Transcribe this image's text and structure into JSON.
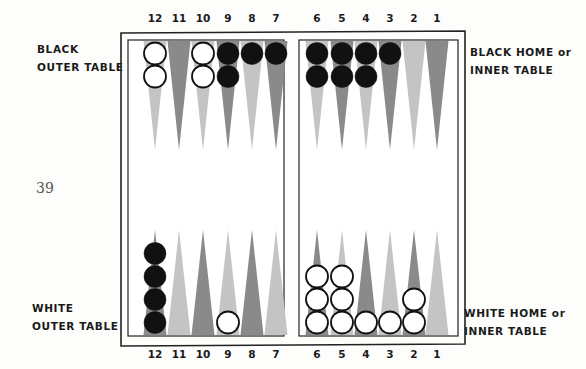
{
  "page_number": "39",
  "labels": {
    "black_outer": [
      "BLACK",
      "OUTER TABLE"
    ],
    "black_home": [
      "BLACK HOME or",
      "INNER TABLE"
    ],
    "white_outer": [
      "WHITE",
      "OUTER TABLE"
    ],
    "white_home": [
      "WHITE HOME or",
      "INNER TABLE"
    ]
  },
  "point_numbers_top": [
    "12",
    "11",
    "10",
    "9",
    "8",
    "7",
    "6",
    "5",
    "4",
    "3",
    "2",
    "1"
  ],
  "point_numbers_bottom": [
    "12",
    "11",
    "10",
    "9",
    "8",
    "7",
    "6",
    "5",
    "4",
    "3",
    "2",
    "1"
  ],
  "colors": {
    "dark_point": "#8a8a8a",
    "light_point": "#c4c4c4",
    "black_checker": "#111111",
    "white_checker": "#ffffff",
    "frame": "#222222"
  },
  "board": {
    "top_points": [
      {
        "point": "12",
        "shade": "light",
        "checkers": {
          "color": "white",
          "count": 2
        }
      },
      {
        "point": "11",
        "shade": "dark",
        "checkers": null
      },
      {
        "point": "10",
        "shade": "light",
        "checkers": {
          "color": "white",
          "count": 2
        }
      },
      {
        "point": "9",
        "shade": "dark",
        "checkers": {
          "color": "black",
          "count": 2
        }
      },
      {
        "point": "8",
        "shade": "light",
        "checkers": {
          "color": "black",
          "count": 1
        }
      },
      {
        "point": "7",
        "shade": "dark",
        "checkers": {
          "color": "black",
          "count": 1
        }
      },
      {
        "point": "6",
        "shade": "light",
        "checkers": {
          "color": "black",
          "count": 2
        }
      },
      {
        "point": "5",
        "shade": "dark",
        "checkers": {
          "color": "black",
          "count": 2
        }
      },
      {
        "point": "4",
        "shade": "light",
        "checkers": {
          "color": "black",
          "count": 2
        }
      },
      {
        "point": "3",
        "shade": "dark",
        "checkers": {
          "color": "black",
          "count": 1
        }
      },
      {
        "point": "2",
        "shade": "light",
        "checkers": null
      },
      {
        "point": "1",
        "shade": "dark",
        "checkers": null
      }
    ],
    "bottom_points": [
      {
        "point": "12",
        "shade": "dark",
        "checkers": {
          "color": "black",
          "count": 4
        }
      },
      {
        "point": "11",
        "shade": "light",
        "checkers": null
      },
      {
        "point": "10",
        "shade": "dark",
        "checkers": null
      },
      {
        "point": "9",
        "shade": "light",
        "checkers": {
          "color": "white",
          "count": 1
        }
      },
      {
        "point": "8",
        "shade": "dark",
        "checkers": null
      },
      {
        "point": "7",
        "shade": "light",
        "checkers": null
      },
      {
        "point": "6",
        "shade": "dark",
        "checkers": {
          "color": "white",
          "count": 3
        }
      },
      {
        "point": "5",
        "shade": "light",
        "checkers": {
          "color": "white",
          "count": 3
        }
      },
      {
        "point": "4",
        "shade": "dark",
        "checkers": {
          "color": "white",
          "count": 1
        }
      },
      {
        "point": "3",
        "shade": "light",
        "checkers": {
          "color": "white",
          "count": 1
        }
      },
      {
        "point": "2",
        "shade": "dark",
        "checkers": {
          "color": "white",
          "count": 2
        }
      },
      {
        "point": "1",
        "shade": "light",
        "checkers": null
      }
    ]
  }
}
